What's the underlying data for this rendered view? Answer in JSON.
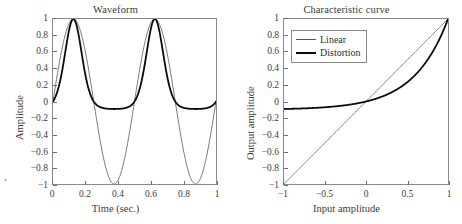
{
  "figure": {
    "width": 462,
    "height": 224,
    "background": "#ffffff",
    "line_color_linear": "#555555",
    "line_color_distortion": "#0c0c0c",
    "axis_color": "#8a8a8a",
    "text_color": "#3c3c3c"
  },
  "corner_mark": "•",
  "panels": {
    "left": {
      "title": "Waveform",
      "xlabel": "Time (sec.)",
      "ylabel": "Amplitude",
      "xticks": [
        "0",
        "0.2",
        "0.4",
        "0.6",
        "0.8",
        "1"
      ],
      "xtick_values": [
        0,
        0.2,
        0.4,
        0.6,
        0.8,
        1
      ],
      "yticks": [
        "1",
        "0.8",
        "0.6",
        "0.4",
        "0.2",
        "0",
        "-0.2",
        "-0.4",
        "-0.6",
        "-0.8",
        "-1"
      ],
      "ytick_values": [
        1,
        0.8,
        0.6,
        0.4,
        0.2,
        0,
        -0.2,
        -0.4,
        -0.6,
        -0.8,
        -1
      ]
    },
    "right": {
      "title": "Characteristic curve",
      "xlabel": "Input amplitude",
      "ylabel": "Output amplitude",
      "xticks": [
        "-1",
        "-0.5",
        "0",
        "0.5",
        "1"
      ],
      "xtick_values": [
        -1,
        -0.5,
        0,
        0.5,
        1
      ],
      "yticks": [
        "1",
        "0.8",
        "0.6",
        "0.4",
        "0.2",
        "0",
        "-0.2",
        "-0.4",
        "-0.6",
        "-0.8",
        "-1"
      ],
      "ytick_values": [
        1,
        0.8,
        0.6,
        0.4,
        0.2,
        0,
        -0.2,
        -0.4,
        -0.6,
        -0.8,
        -1
      ],
      "legend": {
        "position": "upper-left",
        "items": [
          {
            "label": "Linear",
            "style": "linear"
          },
          {
            "label": "Distortion",
            "style": "distortion"
          }
        ]
      }
    }
  },
  "chart_data": [
    {
      "type": "line",
      "title": "Waveform",
      "xlabel": "Time (sec.)",
      "ylabel": "Amplitude",
      "xlim": [
        0,
        1
      ],
      "ylim": [
        -1,
        1
      ],
      "grid": false,
      "legend": null,
      "x": [
        0,
        0.02,
        0.04,
        0.06,
        0.08,
        0.1,
        0.12,
        0.125,
        0.14,
        0.16,
        0.18,
        0.2,
        0.22,
        0.24,
        0.26,
        0.28,
        0.3,
        0.32,
        0.34,
        0.36,
        0.375,
        0.38,
        0.4,
        0.42,
        0.44,
        0.46,
        0.48,
        0.5,
        0.52,
        0.54,
        0.56,
        0.58,
        0.6,
        0.62,
        0.625,
        0.64,
        0.66,
        0.68,
        0.7,
        0.72,
        0.74,
        0.76,
        0.78,
        0.8,
        0.82,
        0.84,
        0.86,
        0.875,
        0.88,
        0.9,
        0.92,
        0.94,
        0.96,
        0.98,
        1
      ],
      "series": [
        {
          "name": "Linear",
          "color": "#555555",
          "width": 0.8,
          "comment": "sin(2*pi*2*t)",
          "values": [
            0,
            0.249,
            0.482,
            0.685,
            0.844,
            0.951,
            0.998,
            1,
            0.988,
            0.916,
            0.79,
            0.618,
            0.412,
            0.187,
            -0.063,
            -0.309,
            -0.539,
            -0.743,
            -0.891,
            -0.978,
            -1,
            -0.998,
            -0.951,
            -0.844,
            -0.685,
            -0.482,
            -0.249,
            0,
            0.249,
            0.482,
            0.685,
            0.844,
            0.951,
            0.998,
            1,
            0.988,
            0.916,
            0.79,
            0.618,
            0.412,
            0.187,
            -0.063,
            -0.309,
            -0.588,
            -0.743,
            -0.891,
            -0.978,
            -1,
            -0.998,
            -0.951,
            -0.844,
            -0.685,
            -0.482,
            -0.249,
            0
          ]
        },
        {
          "name": "Distortion",
          "color": "#0c0c0c",
          "width": 1.8,
          "comment": "y = (exp(2.4*sin(2*pi*2*t)) - 1) / (exp(2.4) - 1)",
          "values": [
            0,
            0.081,
            0.218,
            0.418,
            0.655,
            0.877,
            0.993,
            1,
            0.972,
            0.799,
            0.571,
            0.341,
            0.143,
            -0.012,
            -0.061,
            -0.085,
            -0.095,
            -0.098,
            -0.0995,
            -0.1,
            -0.1,
            -0.1,
            -0.098,
            -0.091,
            -0.079,
            -0.061,
            -0.035,
            0,
            0.081,
            0.218,
            0.418,
            0.655,
            0.877,
            0.993,
            1,
            0.972,
            0.799,
            0.571,
            0.341,
            0.143,
            -0.012,
            -0.061,
            -0.085,
            -0.095,
            -0.098,
            -0.0995,
            -0.1,
            -0.1,
            -0.1,
            -0.098,
            -0.091,
            -0.079,
            -0.061,
            -0.035,
            0
          ]
        }
      ]
    },
    {
      "type": "line",
      "title": "Characteristic curve",
      "xlabel": "Input amplitude",
      "ylabel": "Output amplitude",
      "xlim": [
        -1,
        1
      ],
      "ylim": [
        -1,
        1
      ],
      "grid": false,
      "legend": [
        "Linear",
        "Distortion"
      ],
      "legend_position": "upper-left",
      "x": [
        -1,
        -0.9,
        -0.8,
        -0.7,
        -0.6,
        -0.5,
        -0.4,
        -0.3,
        -0.2,
        -0.1,
        0,
        0.1,
        0.2,
        0.3,
        0.4,
        0.5,
        0.6,
        0.7,
        0.8,
        0.9,
        1
      ],
      "series": [
        {
          "name": "Linear",
          "color": "#555555",
          "width": 0.8,
          "comment": "y = x",
          "values": [
            -1,
            -0.9,
            -0.8,
            -0.7,
            -0.6,
            -0.5,
            -0.4,
            -0.3,
            -0.2,
            -0.1,
            0,
            0.1,
            0.2,
            0.3,
            0.4,
            0.5,
            0.6,
            0.7,
            0.8,
            0.9,
            1
          ]
        },
        {
          "name": "Distortion",
          "color": "#0c0c0c",
          "width": 1.8,
          "comment": "y = (exp(2.4*x) - 1) / (exp(2.4) - 1)",
          "values": [
            -0.0997,
            -0.0995,
            -0.0993,
            -0.0989,
            -0.0984,
            -0.0976,
            -0.0964,
            -0.0948,
            -0.0923,
            -0.0886,
            -0.0829,
            -0.0755,
            -0.0638,
            -0.0487,
            -0.0294,
            -0.0046,
            0.0274,
            0.0684,
            0.1209,
            0.1884,
            0.2749,
            0.3857,
            0.5277,
            0.7098,
            0.9432,
            1.0
          ]
        }
      ]
    }
  ]
}
